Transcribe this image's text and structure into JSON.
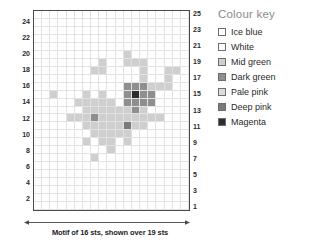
{
  "caption": "Motif of 16 sts, shown over 19 sts",
  "axes": {
    "left_row_numbers": [
      24,
      22,
      20,
      18,
      16,
      14,
      12,
      10,
      8,
      6,
      4,
      2
    ],
    "right_row_numbers": [
      25,
      23,
      21,
      19,
      17,
      15,
      13,
      11,
      9,
      7,
      5,
      3,
      1
    ]
  },
  "colour_key": {
    "title": "Colour key",
    "items": [
      {
        "label": "Ice blue",
        "color": "#ffffff",
        "code": "I"
      },
      {
        "label": "White",
        "color": "#ffffff",
        "code": "W"
      },
      {
        "label": "Mid green",
        "color": "#cfcfcf",
        "code": "M"
      },
      {
        "label": "Dark green",
        "color": "#8f8f8f",
        "code": "D"
      },
      {
        "label": "Pale pink",
        "color": "#dcdcdc",
        "code": "P"
      },
      {
        "label": "Deep pink",
        "color": "#7a7a7a",
        "code": "K"
      },
      {
        "label": "Magenta",
        "color": "#2e2e2e",
        "code": "G"
      }
    ]
  },
  "chart_data": {
    "type": "heatmap",
    "title": "Motif of 16 sts, shown over 19 sts",
    "xlabel": "",
    "ylabel": "",
    "columns": 19,
    "rows": 25,
    "grid": true,
    "legend_position": "right",
    "palette": {
      "I": "#ffffff",
      "W": "#ffffff",
      "M": "#cfcfcf",
      "D": "#8f8f8f",
      "P": "#dcdcdc",
      "K": "#7a7a7a",
      "G": "#2e2e2e"
    },
    "row_labels_top_to_bottom": [
      25,
      24,
      23,
      22,
      21,
      20,
      19,
      18,
      17,
      16,
      15,
      14,
      13,
      12,
      11,
      10,
      9,
      8,
      7,
      6,
      5,
      4,
      3,
      2,
      1
    ],
    "cells_top_to_bottom": [
      "WWWWWWWWWWWWWWWWWWW",
      "WWWWWWWWWWWWWWWWWWW",
      "WWWWWWWWWWWWWWWWWWW",
      "WWWWWWWWWWWWWWWWWWW",
      "WWWWWWWWWWWWWWWWWWW",
      "WWWWWWWWWWWMWWWWWWW",
      "WWWWWWWWMWWMMMWWWWW",
      "WWWWWWWMMWWWWMWWMMW",
      "WWWWWWWWWWWWWMWWMWW",
      "WWWWWWWWWWWDDDMMMWW",
      "WWMWWWMWMWWDGDDWWWW",
      "WWWWWMMMMMWDDDDWWWW",
      "WWWWWWMMMMMMDMWWWWW",
      "WWWWMMMDMMMMMMMMWWW",
      "WWWWWWMMMMMKMMWWWWW",
      "WWWWWWWMMMMMWWWWWWW",
      "WWWWWWMWMMWMWWWWWWW",
      "WWWWWWWWWMWWWWWWWWW",
      "WWWWWWWMWWWWWWWWWWW",
      "WWWWWWWWWWWWWWWWWWW",
      "WWWWWWWWWWWWWWWWWWW",
      "WWWWWWWWWWWWWWWWWWW",
      "WWWWWWWWWWWWWWWWWWW",
      "WWWWWWWWWWWWWWWWWWW",
      "WWWWWWWWWWWWWWWWWWW"
    ]
  }
}
